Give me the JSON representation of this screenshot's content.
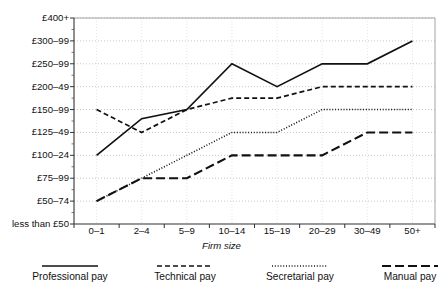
{
  "title_cut": "Firm size",
  "axis": {
    "xlabel": "Firm size",
    "ylabel": ""
  },
  "legend": [
    {
      "label": "Professional pay",
      "style": "solid",
      "x": 70
    },
    {
      "label": "Technical pay",
      "style": "dashed-short",
      "x": 185
    },
    {
      "label": "Secretarial pay",
      "style": "dotted",
      "x": 300
    },
    {
      "label": "Manual pay",
      "style": "dashed-long",
      "x": 410
    }
  ],
  "chart_data": {
    "type": "line",
    "title": "",
    "subtitle": "",
    "xlabel": "Firm size",
    "ylabel": "",
    "grid": true,
    "legend_position": "bottom",
    "categories": [
      "0–1",
      "2–4",
      "5–9",
      "10–14",
      "15–19",
      "20–29",
      "30–49",
      "50+"
    ],
    "ytick_labels": [
      "£400+",
      "£300–99",
      "£250–99",
      "£200–49",
      "£150–99",
      "£125–49",
      "£100–24",
      "£75–99",
      "£50–74",
      "less than £50"
    ],
    "yvalue_index": {
      "less than £50": 0,
      "£50–74": 1,
      "£75–99": 2,
      "£100–24": 3,
      "£125–49": 4,
      "£150–99": 5,
      "£200–49": 6,
      "£250–99": 7,
      "£300–99": 8,
      "£400+": 9
    },
    "series": [
      {
        "name": "Professional pay",
        "style": "solid",
        "values": [
          3,
          4.6,
          5,
          7,
          6,
          7,
          7,
          8
        ],
        "value_labels": [
          "£100–24",
          "£125–49",
          "£150–99",
          "£250–99",
          "£200–49",
          "£250–99",
          "£250–99",
          "£300–99"
        ]
      },
      {
        "name": "Technical pay",
        "style": "dashed-short",
        "values": [
          5,
          4,
          5,
          5.5,
          5.5,
          6,
          6,
          6
        ],
        "value_labels": [
          "£150–99",
          "£125–49",
          "£150–99",
          "£150–99",
          "£150–99",
          "£200–49",
          "£200–49",
          "£200–49"
        ]
      },
      {
        "name": "Secretarial pay",
        "style": "dotted",
        "values": [
          1,
          2,
          3,
          4,
          4,
          5,
          5,
          5
        ],
        "value_labels": [
          "£50–74",
          "£75–99",
          "£100–24",
          "£125–49",
          "£125–49",
          "£150–99",
          "£150–99",
          "£150–99"
        ]
      },
      {
        "name": "Manual pay",
        "style": "dashed-long",
        "values": [
          1,
          2,
          2,
          3,
          3,
          3,
          4,
          4
        ],
        "value_labels": [
          "£50–74",
          "£75–99",
          "£75–99",
          "£100–24",
          "£100–24",
          "£100–24",
          "£125–49",
          "£125–49"
        ]
      }
    ]
  }
}
